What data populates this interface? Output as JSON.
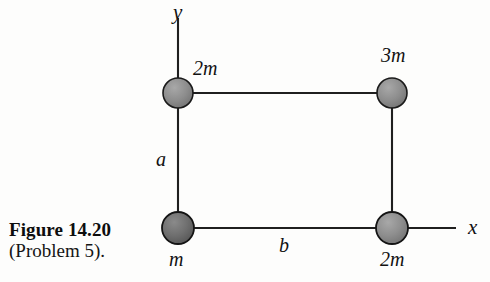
{
  "figure": {
    "caption_title": "Figure 14.20",
    "caption_subtitle": "(Problem 5).",
    "background_color": "#fdfdfc",
    "line_color": "#1a1a1a",
    "sphere_fill_light": "#8c8c8c",
    "sphere_fill_dark": "#6e6e6e",
    "sphere_stroke": "#1a1a1a"
  },
  "axes": {
    "y_label": "y",
    "x_label": "x"
  },
  "masses": {
    "top_left": "2m",
    "top_right": "3m",
    "bottom_left": "m",
    "bottom_right": "2m"
  },
  "dimensions": {
    "vertical_side": "a",
    "horizontal_side": "b"
  },
  "diagram_data": {
    "type": "diagram",
    "description": "Rectangular arrangement of four point masses connected by rigid rods, with origin at the lower-left mass",
    "origin": {
      "x": 178,
      "y": 228
    },
    "nodes": [
      {
        "name": "top-left",
        "cx": 178,
        "cy": 93,
        "r": 15,
        "label": "2m",
        "shade": "light"
      },
      {
        "name": "top-right",
        "cx": 392,
        "cy": 93,
        "r": 15,
        "label": "3m",
        "shade": "light"
      },
      {
        "name": "bottom-left",
        "cx": 178,
        "cy": 228,
        "r": 16,
        "label": "m",
        "shade": "dark"
      },
      {
        "name": "bottom-right",
        "cx": 392,
        "cy": 228,
        "r": 16,
        "label": "2m",
        "shade": "light"
      }
    ],
    "rods": [
      {
        "from": "top-left",
        "to": "top-right"
      },
      {
        "from": "bottom-left",
        "to": "bottom-right"
      },
      {
        "from": "top-left",
        "to": "bottom-left"
      },
      {
        "from": "top-right",
        "to": "bottom-right"
      }
    ],
    "axis_y": {
      "x": 178,
      "y_top": 18,
      "y_bottom": 228
    },
    "axis_x": {
      "y": 228,
      "x_left": 178,
      "x_right": 456
    }
  }
}
